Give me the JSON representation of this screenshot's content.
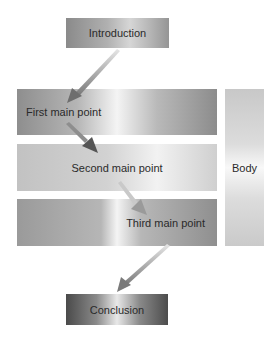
{
  "diagram": {
    "nodes": {
      "introduction": "Introduction",
      "first_main_point": "First main point",
      "second_main_point": "Second main point",
      "third_main_point": "Third main point",
      "conclusion": "Conclusion",
      "body": "Body"
    },
    "flow": [
      "Introduction",
      "First main point",
      "Second main point",
      "Third main point",
      "Conclusion"
    ],
    "grouping": {
      "label": "Body",
      "contains": [
        "First main point",
        "Second main point",
        "Third main point"
      ]
    }
  }
}
